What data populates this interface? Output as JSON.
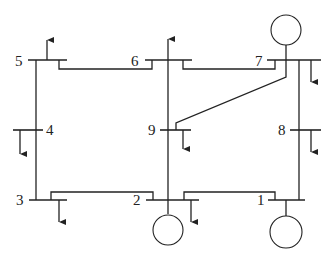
{
  "diagram": {
    "type": "power-system one-line diagram",
    "colors": {
      "line": "#222222",
      "background": "#ffffff"
    },
    "buses": [
      {
        "id": "1",
        "label": "1",
        "generator": true,
        "load": false
      },
      {
        "id": "2",
        "label": "2",
        "generator": true,
        "load": true
      },
      {
        "id": "3",
        "label": "3",
        "generator": false,
        "load": true
      },
      {
        "id": "4",
        "label": "4",
        "generator": false,
        "load": true
      },
      {
        "id": "5",
        "label": "5",
        "generator": false,
        "load": true
      },
      {
        "id": "6",
        "label": "6",
        "generator": false,
        "load": true
      },
      {
        "id": "7",
        "label": "7",
        "generator": true,
        "load": true
      },
      {
        "id": "8",
        "label": "8",
        "generator": false,
        "load": true
      },
      {
        "id": "9",
        "label": "9",
        "generator": false,
        "load": true
      }
    ],
    "branches": [
      {
        "from": "5",
        "to": "6"
      },
      {
        "from": "6",
        "to": "7"
      },
      {
        "from": "5",
        "to": "4"
      },
      {
        "from": "4",
        "to": "3"
      },
      {
        "from": "3",
        "to": "2"
      },
      {
        "from": "2",
        "to": "1"
      },
      {
        "from": "6",
        "to": "9"
      },
      {
        "from": "9",
        "to": "2"
      },
      {
        "from": "7",
        "to": "9"
      },
      {
        "from": "7",
        "to": "8"
      },
      {
        "from": "8",
        "to": "1"
      }
    ]
  }
}
